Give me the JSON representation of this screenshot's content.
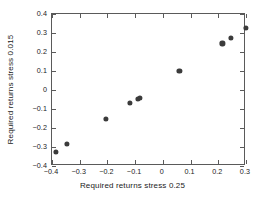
{
  "chart_data": {
    "type": "scatter",
    "title": "",
    "xlabel": "Required returns stress 0.25",
    "ylabel": "Required returns stress 0.015",
    "xlim": [
      -0.4,
      0.3
    ],
    "ylim": [
      -0.4,
      0.4
    ],
    "xticks": [
      -0.4,
      -0.3,
      -0.2,
      -0.1,
      0,
      0.1,
      0.2,
      0.3
    ],
    "yticks": [
      -0.4,
      -0.3,
      -0.2,
      -0.1,
      0,
      0.1,
      0.2,
      0.3,
      0.4
    ],
    "xticklabels": [
      "-0.4",
      "-0.3",
      "-0.2",
      "-0.1",
      "0",
      "0.1",
      "0.2",
      "0.3"
    ],
    "yticklabels": [
      "-0.4",
      "-0.3",
      "-0.2",
      "-0.1",
      "0",
      "0.1",
      "0.2",
      "0.3",
      "0.4"
    ],
    "grid": false,
    "legend": null,
    "marker": "filled-circle",
    "marker_color": "#3b3b3b",
    "frame_color": "#5a5a5a",
    "background": "#ffffff",
    "x": [
      -0.385,
      -0.345,
      -0.205,
      -0.12,
      -0.09,
      -0.082,
      0.06,
      0.215,
      0.245,
      0.3
    ],
    "y": [
      -0.325,
      -0.285,
      -0.152,
      -0.07,
      -0.045,
      -0.043,
      0.1,
      0.245,
      0.275,
      0.328
    ],
    "points": [
      {
        "x": -0.385,
        "y": -0.325
      },
      {
        "x": -0.345,
        "y": -0.285
      },
      {
        "x": -0.205,
        "y": -0.152
      },
      {
        "x": -0.12,
        "y": -0.07
      },
      {
        "x": -0.09,
        "y": -0.045
      },
      {
        "x": -0.082,
        "y": -0.043
      },
      {
        "x": 0.06,
        "y": 0.1
      },
      {
        "x": 0.215,
        "y": 0.245
      },
      {
        "x": 0.245,
        "y": 0.275
      },
      {
        "x": 0.3,
        "y": 0.328
      }
    ]
  }
}
